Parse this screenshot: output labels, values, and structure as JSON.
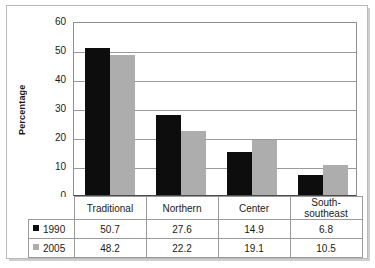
{
  "chart_data": {
    "type": "bar",
    "title": "",
    "xlabel": "",
    "ylabel": "Percentage",
    "ylim": [
      0,
      60
    ],
    "ytick_step": 10,
    "yticks": [
      "60",
      "50",
      "40",
      "30",
      "20",
      "10",
      "0"
    ],
    "grid": true,
    "legend_position": "table-left-column",
    "categories": [
      "Traditional",
      "Northern",
      "Center",
      "South-southeast"
    ],
    "series": [
      {
        "name": "1990",
        "marker": "black-square",
        "color": "#0d0d0d",
        "values": [
          50.7,
          27.6,
          14.9,
          6.8
        ],
        "value_labels": [
          "50.7",
          "27.6",
          "14.9",
          "6.8"
        ]
      },
      {
        "name": "2005",
        "marker": "gray-square",
        "color": "#adadad",
        "values": [
          48.2,
          22.2,
          19.1,
          10.5
        ],
        "value_labels": [
          "48.2",
          "22.2",
          "19.1",
          "10.5"
        ]
      }
    ]
  },
  "colors": {
    "series_1990": "#0d0d0d",
    "series_2005": "#adadad",
    "gridline": "#9a9a9a",
    "axis": "#4a4a4a",
    "frame": "#b9b9b9",
    "text": "#1a1a1a"
  }
}
